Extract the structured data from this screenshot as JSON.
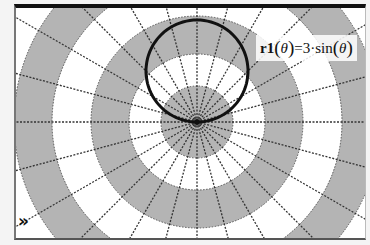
{
  "chart_data": {
    "type": "polar-line",
    "title": "",
    "series": [
      {
        "name": "r1",
        "expression": "r1(θ)=3·sin(θ)",
        "function": "r = 3*sin(theta)",
        "color": "#111111",
        "line_width": 3
      }
    ],
    "polar_grid": {
      "radial_line_step_degrees": 15,
      "ring_count_visible": 5,
      "band_colors": [
        "#b4b4b4",
        "#ffffff"
      ],
      "radial_line_style": "dotted",
      "radial_line_color": "#333333"
    },
    "origin_px": [
      197,
      122
    ],
    "circle_extent": {
      "center_r": 1.5,
      "diameter_r": 3
    },
    "axis_labels_visible": false,
    "legend": "inline label near trace"
  },
  "graph": {
    "label": {
      "fname": "r1",
      "open": "(",
      "var": "θ",
      "close": ")",
      "rhs_prefix": "=3·sin",
      "rhs_open": "(",
      "rhs_var": "θ",
      "rhs_close": ")"
    },
    "expand_icon": "»"
  },
  "colors": {
    "band_gray": "#b4b4b4",
    "band_white": "#ffffff",
    "trace": "#111111",
    "frame_top": "#111111"
  }
}
